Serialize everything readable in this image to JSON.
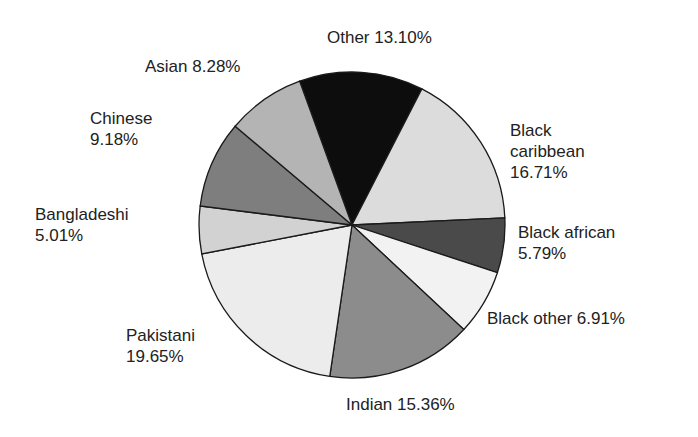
{
  "chart_data": {
    "type": "pie",
    "title": "",
    "start_angle_deg": -110,
    "direction": "clockwise",
    "slices": [
      {
        "label": "Other",
        "value": 13.1,
        "display": "13.10%",
        "color": "#0d0d0d"
      },
      {
        "label": "Black caribbean",
        "value": 16.71,
        "display": "16.71%",
        "color": "#dcdcdc"
      },
      {
        "label": "Black african",
        "value": 5.79,
        "display": "5.79%",
        "color": "#4a4a4a"
      },
      {
        "label": "Black other",
        "value": 6.91,
        "display": "6.91%",
        "color": "#f2f2f2"
      },
      {
        "label": "Indian",
        "value": 15.36,
        "display": "15.36%",
        "color": "#8c8c8c"
      },
      {
        "label": "Pakistani",
        "value": 19.65,
        "display": "19.65%",
        "color": "#ececec"
      },
      {
        "label": "Bangladeshi",
        "value": 5.01,
        "display": "5.01%",
        "color": "#d2d2d2"
      },
      {
        "label": "Chinese",
        "value": 9.18,
        "display": "9.18%",
        "color": "#7e7e7e"
      },
      {
        "label": "Asian",
        "value": 8.28,
        "display": "8.28%",
        "color": "#b4b4b4"
      }
    ]
  },
  "labels": {
    "other": {
      "line1": "Other 13.10%"
    },
    "black_caribbean": {
      "line1": "Black",
      "line2": "caribbean",
      "line3": "16.71%"
    },
    "black_african": {
      "line1": "Black african",
      "line2": "5.79%"
    },
    "black_other": {
      "line1": "Black other 6.91%"
    },
    "indian": {
      "line1": "Indian 15.36%"
    },
    "pakistani": {
      "line1": "Pakistani",
      "line2": "19.65%"
    },
    "bangladeshi": {
      "line1": "Bangladeshi",
      "line2": "5.01%"
    },
    "chinese": {
      "line1": "Chinese",
      "line2": "9.18%"
    },
    "asian": {
      "line1": "Asian 8.28%"
    }
  }
}
